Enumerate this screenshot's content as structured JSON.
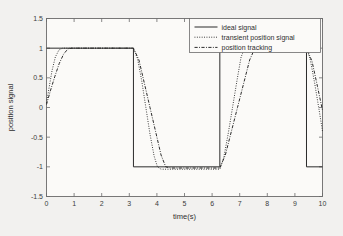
{
  "chart_data": {
    "type": "line",
    "title": "",
    "xlabel": "time(s)",
    "ylabel": "position signal",
    "xlim": [
      0,
      10
    ],
    "ylim": [
      -1.5,
      1.5
    ],
    "xticks": [
      0,
      1,
      2,
      3,
      4,
      5,
      6,
      7,
      8,
      9,
      10
    ],
    "yticks": [
      -1.5,
      -1,
      -0.5,
      0,
      0.5,
      1,
      1.5
    ],
    "xticklabels": [
      "0",
      "1",
      "2",
      "3",
      "4",
      "5",
      "6",
      "7",
      "8",
      "9",
      "10"
    ],
    "yticklabels": [
      "-1.5",
      "-1",
      "-0.5",
      "0",
      "0.5",
      "1",
      "1.5"
    ],
    "grid": false,
    "legend_position": "top-right",
    "line_color": "#2b2b2b",
    "series": [
      {
        "name": "ideal signal",
        "style": "solid",
        "points": [
          [
            0,
            1
          ],
          [
            3.15,
            1
          ],
          [
            3.15,
            -1
          ],
          [
            6.28,
            -1
          ],
          [
            6.28,
            1
          ],
          [
            9.42,
            1
          ],
          [
            9.42,
            -1
          ],
          [
            10,
            -1
          ]
        ]
      },
      {
        "name": "transient position signal",
        "style": "dotted",
        "points": [
          [
            0,
            0.08
          ],
          [
            0.1,
            0.35
          ],
          [
            0.2,
            0.62
          ],
          [
            0.32,
            0.85
          ],
          [
            0.45,
            0.97
          ],
          [
            0.58,
            1.0
          ],
          [
            3.15,
            1.0
          ],
          [
            3.3,
            0.82
          ],
          [
            3.45,
            0.45
          ],
          [
            3.6,
            0.0
          ],
          [
            3.75,
            -0.45
          ],
          [
            3.9,
            -0.82
          ],
          [
            4.02,
            -1.0
          ],
          [
            4.15,
            -1.04
          ],
          [
            6.28,
            -1.04
          ],
          [
            6.42,
            -0.85
          ],
          [
            6.58,
            -0.45
          ],
          [
            6.74,
            0.0
          ],
          [
            6.9,
            0.45
          ],
          [
            7.05,
            0.85
          ],
          [
            7.18,
            1.0
          ],
          [
            9.42,
            1.0
          ],
          [
            9.56,
            0.8
          ],
          [
            9.72,
            0.4
          ],
          [
            9.88,
            -0.05
          ],
          [
            10,
            -0.4
          ]
        ]
      },
      {
        "name": "position tracking",
        "style": "dash-dot",
        "points": [
          [
            0,
            0.05
          ],
          [
            0.14,
            0.28
          ],
          [
            0.3,
            0.52
          ],
          [
            0.46,
            0.74
          ],
          [
            0.62,
            0.9
          ],
          [
            0.78,
            0.99
          ],
          [
            0.92,
            1.0
          ],
          [
            3.15,
            1.0
          ],
          [
            3.35,
            0.8
          ],
          [
            3.55,
            0.4
          ],
          [
            3.75,
            0.0
          ],
          [
            3.95,
            -0.4
          ],
          [
            4.15,
            -0.8
          ],
          [
            4.32,
            -1.0
          ],
          [
            4.5,
            -1.02
          ],
          [
            6.28,
            -1.02
          ],
          [
            6.48,
            -0.8
          ],
          [
            6.7,
            -0.4
          ],
          [
            6.92,
            0.0
          ],
          [
            7.14,
            0.4
          ],
          [
            7.36,
            0.8
          ],
          [
            7.55,
            1.0
          ],
          [
            9.42,
            1.0
          ],
          [
            9.62,
            0.78
          ],
          [
            9.82,
            0.35
          ],
          [
            10,
            -0.05
          ]
        ]
      }
    ],
    "legend_entries": [
      {
        "label": "ideal signal",
        "style": "solid"
      },
      {
        "label": "transient position signal",
        "style": "dotted"
      },
      {
        "label": "position tracking",
        "style": "dash-dot"
      }
    ]
  }
}
